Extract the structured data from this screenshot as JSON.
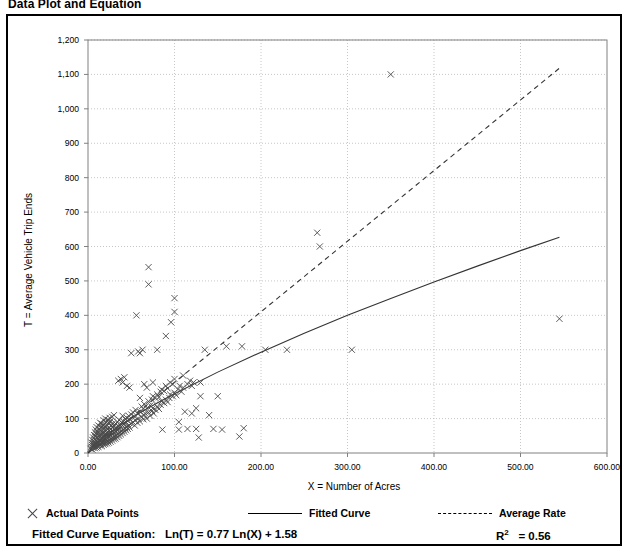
{
  "title": "Data Plot and Equation",
  "legend": {
    "points_label": "Actual Data Points",
    "fitted_label": "Fitted Curve",
    "average_label": "Average Rate",
    "points_marker": "x-marker-icon",
    "fitted_marker": "solid-line-icon",
    "average_marker": "dashed-line-icon"
  },
  "equation": {
    "prefix": "Fitted Curve Equation:",
    "formula": "Ln(T) = 0.77 Ln(X) + 1.58",
    "r2_label": "R",
    "r2_exp": "2",
    "r2_value": "= 0.56"
  },
  "chart_data": {
    "type": "scatter",
    "title": "Data Plot and Equation",
    "xlabel": "X = Number of Acres",
    "ylabel": "T = Average Vehicle Trip Ends",
    "xlim": [
      0,
      600
    ],
    "ylim": [
      0,
      1200
    ],
    "xticks": [
      0,
      100,
      200,
      300,
      400,
      500,
      600
    ],
    "xticklabels": [
      "0.00",
      "100.00",
      "200.00",
      "300.00",
      "400.00",
      "500.00",
      "600.00"
    ],
    "yticks": [
      0,
      100,
      200,
      300,
      400,
      500,
      600,
      700,
      800,
      900,
      1000,
      1100,
      1200
    ],
    "yticklabels": [
      "0",
      "100",
      "200",
      "300",
      "400",
      "500",
      "600",
      "700",
      "800",
      "900",
      "1,000",
      "1,100",
      "1,200"
    ],
    "grid": true,
    "grid_style": "dotted",
    "legend_position": "below-plot",
    "marker": "x",
    "series": [
      {
        "name": "Actual Data Points",
        "type": "scatter",
        "points": [
          [
            3,
            12
          ],
          [
            4,
            18
          ],
          [
            4,
            30
          ],
          [
            5,
            10
          ],
          [
            5,
            22
          ],
          [
            5,
            38
          ],
          [
            6,
            15
          ],
          [
            6,
            28
          ],
          [
            6,
            45
          ],
          [
            7,
            20
          ],
          [
            7,
            33
          ],
          [
            7,
            52
          ],
          [
            8,
            14
          ],
          [
            8,
            26
          ],
          [
            8,
            40
          ],
          [
            8,
            60
          ],
          [
            9,
            18
          ],
          [
            9,
            30
          ],
          [
            9,
            48
          ],
          [
            9,
            68
          ],
          [
            10,
            16
          ],
          [
            10,
            25
          ],
          [
            10,
            35
          ],
          [
            10,
            55
          ],
          [
            10,
            75
          ],
          [
            11,
            20
          ],
          [
            11,
            32
          ],
          [
            11,
            46
          ],
          [
            11,
            62
          ],
          [
            12,
            18
          ],
          [
            12,
            28
          ],
          [
            12,
            42
          ],
          [
            12,
            58
          ],
          [
            12,
            80
          ],
          [
            13,
            24
          ],
          [
            13,
            36
          ],
          [
            13,
            50
          ],
          [
            13,
            70
          ],
          [
            14,
            22
          ],
          [
            14,
            34
          ],
          [
            14,
            48
          ],
          [
            14,
            66
          ],
          [
            14,
            88
          ],
          [
            15,
            26
          ],
          [
            15,
            40
          ],
          [
            15,
            56
          ],
          [
            15,
            76
          ],
          [
            16,
            20
          ],
          [
            16,
            32
          ],
          [
            16,
            45
          ],
          [
            16,
            62
          ],
          [
            16,
            85
          ],
          [
            17,
            28
          ],
          [
            17,
            42
          ],
          [
            17,
            58
          ],
          [
            17,
            78
          ],
          [
            18,
            24
          ],
          [
            18,
            38
          ],
          [
            18,
            52
          ],
          [
            18,
            72
          ],
          [
            18,
            95
          ],
          [
            19,
            30
          ],
          [
            19,
            44
          ],
          [
            19,
            60
          ],
          [
            19,
            82
          ],
          [
            20,
            26
          ],
          [
            20,
            40
          ],
          [
            20,
            55
          ],
          [
            20,
            75
          ],
          [
            20,
            100
          ],
          [
            21,
            32
          ],
          [
            21,
            48
          ],
          [
            21,
            66
          ],
          [
            21,
            90
          ],
          [
            22,
            28
          ],
          [
            22,
            42
          ],
          [
            22,
            58
          ],
          [
            22,
            80
          ],
          [
            23,
            35
          ],
          [
            23,
            50
          ],
          [
            23,
            70
          ],
          [
            23,
            96
          ],
          [
            24,
            30
          ],
          [
            24,
            46
          ],
          [
            24,
            64
          ],
          [
            24,
            88
          ],
          [
            25,
            38
          ],
          [
            25,
            54
          ],
          [
            25,
            74
          ],
          [
            25,
            102
          ],
          [
            26,
            33
          ],
          [
            26,
            50
          ],
          [
            26,
            68
          ],
          [
            26,
            92
          ],
          [
            27,
            42
          ],
          [
            27,
            60
          ],
          [
            27,
            80
          ],
          [
            28,
            36
          ],
          [
            28,
            55
          ],
          [
            28,
            75
          ],
          [
            28,
            105
          ],
          [
            29,
            45
          ],
          [
            29,
            64
          ],
          [
            29,
            86
          ],
          [
            30,
            40
          ],
          [
            30,
            58
          ],
          [
            30,
            78
          ],
          [
            30,
            110
          ],
          [
            31,
            48
          ],
          [
            31,
            68
          ],
          [
            32,
            42
          ],
          [
            32,
            62
          ],
          [
            32,
            85
          ],
          [
            33,
            52
          ],
          [
            33,
            72
          ],
          [
            34,
            46
          ],
          [
            34,
            66
          ],
          [
            34,
            90
          ],
          [
            35,
            56
          ],
          [
            35,
            78
          ],
          [
            35,
            210
          ],
          [
            36,
            50
          ],
          [
            36,
            70
          ],
          [
            36,
            96
          ],
          [
            37,
            60
          ],
          [
            37,
            82
          ],
          [
            38,
            54
          ],
          [
            38,
            75
          ],
          [
            38,
            215
          ],
          [
            39,
            64
          ],
          [
            39,
            88
          ],
          [
            40,
            58
          ],
          [
            40,
            80
          ],
          [
            40,
            108
          ],
          [
            40,
            205
          ],
          [
            41,
            68
          ],
          [
            41,
            92
          ],
          [
            42,
            62
          ],
          [
            42,
            85
          ],
          [
            42,
            220
          ],
          [
            43,
            72
          ],
          [
            43,
            98
          ],
          [
            44,
            66
          ],
          [
            44,
            90
          ],
          [
            45,
            76
          ],
          [
            45,
            102
          ],
          [
            45,
            195
          ],
          [
            46,
            70
          ],
          [
            46,
            94
          ],
          [
            47,
            80
          ],
          [
            47,
            108
          ],
          [
            48,
            74
          ],
          [
            48,
            98
          ],
          [
            48,
            190
          ],
          [
            50,
            85
          ],
          [
            50,
            112
          ],
          [
            50,
            290
          ],
          [
            52,
            90
          ],
          [
            52,
            118
          ],
          [
            54,
            80
          ],
          [
            54,
            105
          ],
          [
            55,
            95
          ],
          [
            55,
            125
          ],
          [
            56,
            400
          ],
          [
            57,
            88
          ],
          [
            57,
            115
          ],
          [
            58,
            295
          ],
          [
            58,
            100
          ],
          [
            60,
            92
          ],
          [
            60,
            120
          ],
          [
            60,
            160
          ],
          [
            60,
            290
          ],
          [
            62,
            105
          ],
          [
            62,
            135
          ],
          [
            63,
            300
          ],
          [
            64,
            98
          ],
          [
            64,
            128
          ],
          [
            65,
            110
          ],
          [
            65,
            142
          ],
          [
            65,
            200
          ],
          [
            66,
            115
          ],
          [
            68,
            100
          ],
          [
            68,
            130
          ],
          [
            68,
            190
          ],
          [
            70,
            118
          ],
          [
            70,
            150
          ],
          [
            70,
            490
          ],
          [
            70,
            540
          ],
          [
            72,
            108
          ],
          [
            72,
            138
          ],
          [
            74,
            122
          ],
          [
            74,
            155
          ],
          [
            75,
            130
          ],
          [
            75,
            165
          ],
          [
            75,
            205
          ],
          [
            76,
            115
          ],
          [
            78,
            125
          ],
          [
            78,
            160
          ],
          [
            80,
            135
          ],
          [
            80,
            170
          ],
          [
            80,
            300
          ],
          [
            82,
            128
          ],
          [
            82,
            162
          ],
          [
            84,
            140
          ],
          [
            84,
            178
          ],
          [
            85,
            150
          ],
          [
            85,
            185
          ],
          [
            86,
            68
          ],
          [
            88,
            145
          ],
          [
            88,
            180
          ],
          [
            90,
            155
          ],
          [
            90,
            195
          ],
          [
            90,
            340
          ],
          [
            92,
            148
          ],
          [
            92,
            188
          ],
          [
            94,
            160
          ],
          [
            95,
            170
          ],
          [
            95,
            205
          ],
          [
            96,
            380
          ],
          [
            98,
            165
          ],
          [
            98,
            200
          ],
          [
            100,
            175
          ],
          [
            100,
            215
          ],
          [
            100,
            410
          ],
          [
            100,
            450
          ],
          [
            102,
            168
          ],
          [
            104,
            185
          ],
          [
            105,
            68
          ],
          [
            105,
            90
          ],
          [
            106,
            195
          ],
          [
            108,
            178
          ],
          [
            110,
            190
          ],
          [
            110,
            225
          ],
          [
            112,
            120
          ],
          [
            115,
            200
          ],
          [
            115,
            70
          ],
          [
            118,
            210
          ],
          [
            120,
            115
          ],
          [
            120,
            195
          ],
          [
            122,
            205
          ],
          [
            125,
            130
          ],
          [
            125,
            70
          ],
          [
            128,
            45
          ],
          [
            130,
            205
          ],
          [
            130,
            165
          ],
          [
            135,
            300
          ],
          [
            140,
            110
          ],
          [
            145,
            70
          ],
          [
            150,
            165
          ],
          [
            155,
            68
          ],
          [
            160,
            310
          ],
          [
            175,
            48
          ],
          [
            178,
            310
          ],
          [
            180,
            72
          ],
          [
            205,
            300
          ],
          [
            230,
            300
          ],
          [
            265,
            640
          ],
          [
            268,
            600
          ],
          [
            305,
            300
          ],
          [
            350,
            1100
          ],
          [
            545,
            390
          ]
        ]
      },
      {
        "name": "Fitted Curve",
        "type": "line",
        "style": "solid",
        "equation": "Ln(T) = 0.77 Ln(X) + 1.58",
        "r_squared": 0.56,
        "points": [
          [
            0,
            0
          ],
          [
            5,
            17
          ],
          [
            10,
            29
          ],
          [
            20,
            50
          ],
          [
            40,
            85
          ],
          [
            60,
            117
          ],
          [
            80,
            145
          ],
          [
            100,
            172
          ],
          [
            150,
            235
          ],
          [
            200,
            293
          ],
          [
            250,
            348
          ],
          [
            300,
            400
          ],
          [
            350,
            449
          ],
          [
            400,
            497
          ],
          [
            450,
            543
          ],
          [
            500,
            588
          ],
          [
            545,
            627
          ]
        ]
      },
      {
        "name": "Average Rate",
        "type": "line",
        "style": "dashed",
        "points": [
          [
            0,
            0
          ],
          [
            545,
            1118
          ]
        ]
      }
    ]
  }
}
